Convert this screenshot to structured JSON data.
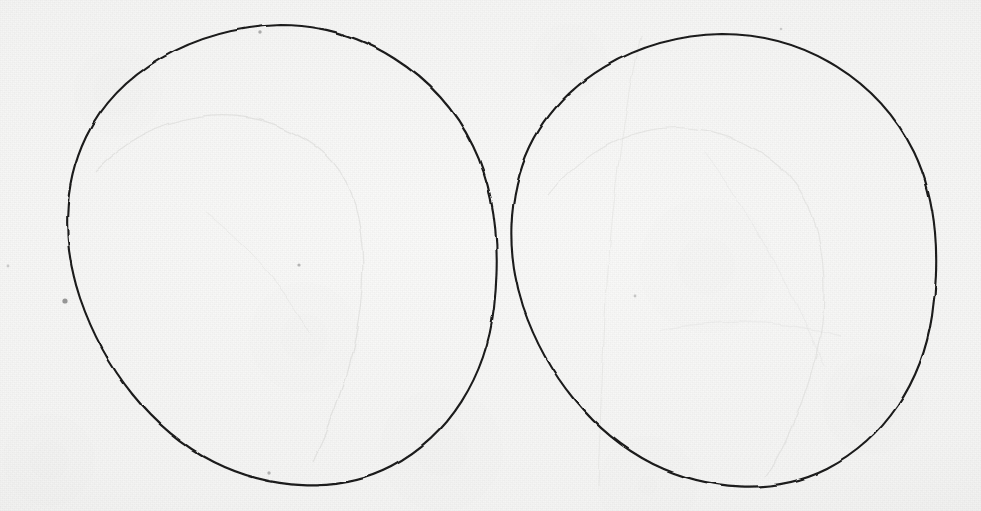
{
  "document": {
    "kind": "scanned-paper-drawing",
    "title": "Two hand-drawn circles",
    "medium": "ink-on-paper",
    "width": 981,
    "height": 511,
    "has_text": false,
    "visible_text": "",
    "paper_color": "#f5f5f4",
    "paper_highlight": "#fafaf9",
    "paper_shadow": "#ebebea",
    "ink_color": "#1a1a1a",
    "faint_pencil_color": "#c9c9c6"
  },
  "figure": {
    "type": "two-tangent-circles",
    "shapes": [
      {
        "id": "left-circle",
        "name": "left-circle",
        "cx": 279,
        "cy": 254,
        "rx": 217,
        "ry": 229,
        "rotation": -2,
        "bounds": {
          "left": 62,
          "top": 25,
          "right": 496,
          "bottom": 483
        },
        "stroke": "#1a1a1a",
        "stroke_width": 2.1,
        "fill": "none"
      },
      {
        "id": "right-circle",
        "name": "right-circle",
        "cx": 723,
        "cy": 259,
        "rx": 215,
        "ry": 225,
        "rotation": 1.5,
        "bounds": {
          "left": 508,
          "top": 34,
          "right": 938,
          "bottom": 484
        },
        "stroke": "#1a1a1a",
        "stroke_width": 2.1,
        "fill": "none"
      }
    ],
    "tangent_gap": {
      "x": 502,
      "y": 256,
      "gap_px": 12
    },
    "faint_marks": [
      {
        "id": "pencil-arc-left",
        "name": "faint-pencil-arc-left",
        "opacity": 0.14
      },
      {
        "id": "pencil-arc-right",
        "name": "faint-pencil-arc-right",
        "opacity": 0.13
      },
      {
        "id": "pencil-crease-right",
        "name": "faint-pencil-crease-right",
        "opacity": 0.12
      }
    ],
    "specks": [
      {
        "id": "speck-1",
        "cx": 65,
        "cy": 301,
        "r": 2.6,
        "opacity": 0.55
      },
      {
        "id": "speck-2",
        "cx": 260,
        "cy": 32,
        "r": 1.7,
        "opacity": 0.45
      },
      {
        "id": "speck-3",
        "cx": 299,
        "cy": 265,
        "r": 1.6,
        "opacity": 0.42
      },
      {
        "id": "speck-4",
        "cx": 269,
        "cy": 473,
        "r": 1.7,
        "opacity": 0.4
      },
      {
        "id": "speck-5",
        "cx": 635,
        "cy": 296,
        "r": 1.4,
        "opacity": 0.33
      },
      {
        "id": "speck-6",
        "cx": 781,
        "cy": 29,
        "r": 1.3,
        "opacity": 0.3
      },
      {
        "id": "speck-7",
        "cx": 8,
        "cy": 266,
        "r": 1.4,
        "opacity": 0.3
      }
    ]
  }
}
